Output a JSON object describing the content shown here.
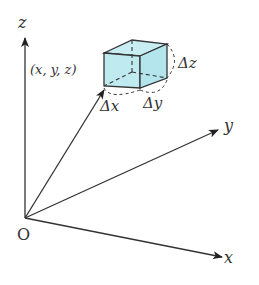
{
  "diagram": {
    "axes": {
      "z_label": "z",
      "y_label": "y",
      "x_label": "x",
      "origin_label": "O"
    },
    "point_label": "(x, y, z)",
    "box_labels": {
      "dx": "Δx",
      "dy": "Δy",
      "dz": "Δz"
    },
    "colors": {
      "box_fill": "#bfeaf0",
      "line": "#333333",
      "background": "#ffffff"
    }
  }
}
